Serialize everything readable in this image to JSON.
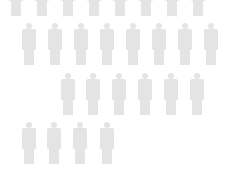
{
  "chart_data": {
    "type": "pictogram",
    "title": "",
    "icon": "person-icon",
    "icon_color": "#e4e4e4",
    "background": "#ffffff",
    "rows": [
      {
        "count": 8,
        "note": "partially cropped at top (legs only)"
      },
      {
        "count": 8
      },
      {
        "count": 6
      },
      {
        "count": 4
      }
    ],
    "values": [
      8,
      8,
      6,
      4
    ],
    "total_icons": 26
  },
  "layout": {
    "rows": [
      {
        "top": -26,
        "x_centers": [
          16,
          42,
          68,
          94,
          120,
          146,
          172,
          198
        ]
      },
      {
        "top": 23,
        "x_centers": [
          29,
          55,
          81,
          107,
          133,
          159,
          185,
          211
        ]
      },
      {
        "top": 73,
        "x_centers": [
          68,
          93,
          119,
          145,
          171,
          197
        ]
      },
      {
        "top": 122,
        "x_centers": [
          29,
          54,
          80,
          107
        ]
      }
    ]
  }
}
